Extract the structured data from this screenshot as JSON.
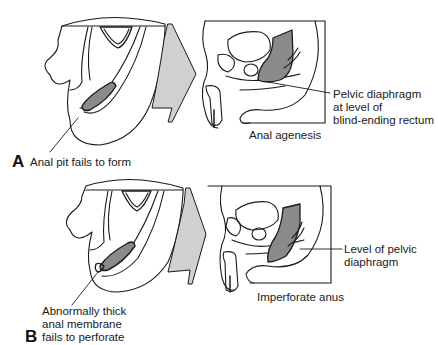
{
  "figure": {
    "colors": {
      "line": "#1a1a1a",
      "rectum_fill": "#8a8a8a",
      "arrow_fill": "#d0d0d0",
      "background": "#ffffff"
    },
    "panels": [
      {
        "letter": "A",
        "embryo_label": "Anal pit fails to form",
        "result_caption": "Anal agenesis",
        "annotation_lines": [
          "Pelvic diaphragm",
          "at level of",
          "blind-ending rectum"
        ]
      },
      {
        "letter": "B",
        "embryo_label_lines": [
          "Abnormally thick",
          "anal membrane",
          "fails to perforate"
        ],
        "result_caption": "Imperforate anus",
        "annotation_lines": [
          "Level of pelvic",
          "diaphragm"
        ]
      }
    ]
  }
}
